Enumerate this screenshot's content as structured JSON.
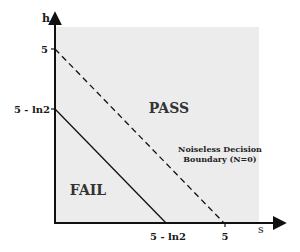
{
  "diagram": {
    "axes": {
      "x_label": "s",
      "y_label": "h",
      "x_ticks": [
        "5 - ln2",
        "5"
      ],
      "y_ticks": [
        "5",
        "5 - ln2"
      ]
    },
    "regions": {
      "pass": "PASS",
      "fail": "FAIL"
    },
    "annotation": {
      "line1": "Noiseless Decision",
      "line2": "Boundary (N=0)"
    },
    "colors": {
      "background": "#ffffff",
      "shaded_region": "#ececec",
      "axis": "#111111",
      "lines": "#111111"
    },
    "lines": [
      {
        "name": "noisy-boundary",
        "style": "solid",
        "from": "(0, 5 - ln2)",
        "to": "(5 - ln2, 0)"
      },
      {
        "name": "noiseless-boundary",
        "style": "dashed",
        "from": "(0, 5)",
        "to": "(5, 0)"
      }
    ]
  }
}
